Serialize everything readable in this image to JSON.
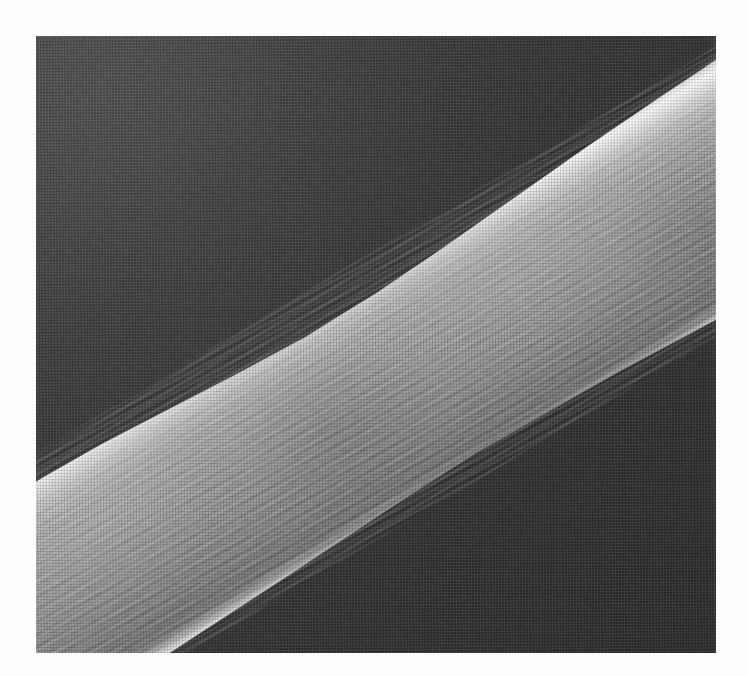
{
  "document": {
    "kind": "printed-scientific-plate",
    "caption": "",
    "page_background_color": "#fdfdfd"
  },
  "plate": {
    "name": "sem-micrograph",
    "subject": "fiber",
    "modality": "scanning electron micrograph",
    "print_process": "halftone screen, scanned",
    "frame": {
      "x": 36,
      "y": 36,
      "width": 680,
      "height": 617
    },
    "background_color": "#393939",
    "highlight_color": "#ffffff",
    "midtone_color": "#949494",
    "shadow_color": "#262626"
  },
  "image_content": {
    "type": "micrograph",
    "description": "A single fiber running diagonally from the lower-left corner to the upper-right corner of the frame, imaged against a dark featureless background.",
    "features": [
      {
        "name": "fiber-shaft",
        "orientation_degrees": -30.5,
        "note": "Broad ribbon-like filament with a slight waist near mid-frame; widens toward the lower left and the upper right."
      },
      {
        "name": "upper-edge-highlight",
        "note": "Bright near-white specular rim along the upper-left flank of the fiber."
      },
      {
        "name": "lower-edge-highlight",
        "note": "Narrower bright rim along the lower-right flank, bordered by a dark cast shadow."
      },
      {
        "name": "longitudinal-striations",
        "note": "Dense fine fibrillar striations running parallel to the fiber axis across the whole shaft."
      },
      {
        "name": "left-edge-nub",
        "note": "Small bright rounded protrusion on the left border of the frame, on the lower flank of the fiber."
      },
      {
        "name": "background",
        "note": "Dark grey halftone field, slightly brighter at upper left and darkest at lower right."
      }
    ]
  }
}
